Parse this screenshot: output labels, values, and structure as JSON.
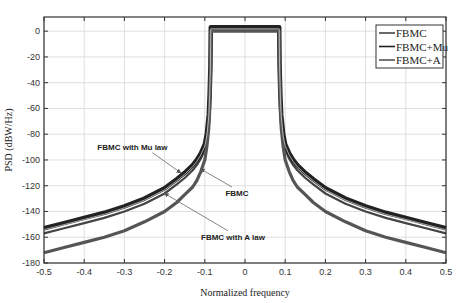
{
  "chart_data": {
    "type": "line",
    "title": "",
    "xlabel": "Normalized frequency",
    "ylabel": "PSD (dBW/Hz)",
    "xlim": [
      -0.5,
      0.5
    ],
    "ylim": [
      -180,
      11
    ],
    "xticks": [
      -0.5,
      -0.4,
      -0.3,
      -0.2,
      -0.1,
      0,
      0.1,
      0.2,
      0.3,
      0.4,
      0.5
    ],
    "xtick_labels": [
      "-0.5",
      "-0.4",
      "-0.3",
      "-0.2",
      "-0.1",
      "0",
      "0.1",
      "0.2",
      "0.3",
      "0.4",
      "0.5"
    ],
    "yticks": [
      0,
      -20,
      -40,
      -60,
      -80,
      -100,
      -120,
      -140,
      -160,
      -180
    ],
    "ytick_labels": [
      "0",
      "-20",
      "-40",
      "-60",
      "-80",
      "-100",
      "-120",
      "-140",
      "-160",
      "-180"
    ],
    "grid": true,
    "legend_position": "upper right",
    "x": [
      -0.5,
      -0.45,
      -0.4,
      -0.35,
      -0.3,
      -0.25,
      -0.2,
      -0.17,
      -0.15,
      -0.13,
      -0.12,
      -0.11,
      -0.1,
      -0.095,
      -0.09,
      -0.088,
      -0.086,
      -0.085,
      0,
      0.085,
      0.086,
      0.088,
      0.09,
      0.095,
      0.1,
      0.11,
      0.12,
      0.13,
      0.15,
      0.17,
      0.2,
      0.25,
      0.3,
      0.35,
      0.4,
      0.45,
      0.5
    ],
    "series": [
      {
        "name": "FBMC",
        "color": "#444444",
        "values": [
          -157,
          -153,
          -149,
          -145,
          -140,
          -134,
          -126,
          -119,
          -114,
          -108,
          -104,
          -99,
          -92,
          -84,
          -70,
          -55,
          -30,
          2,
          2,
          2,
          -30,
          -55,
          -70,
          -84,
          -92,
          -99,
          -104,
          -108,
          -114,
          -119,
          -126,
          -134,
          -140,
          -145,
          -149,
          -153,
          -157
        ]
      },
      {
        "name": "FBMC+Mu",
        "color": "#222222",
        "values": [
          -153,
          -149,
          -145,
          -141,
          -136,
          -130,
          -122,
          -115,
          -110,
          -104,
          -100,
          -95,
          -88,
          -80,
          -65,
          -50,
          -28,
          3,
          3,
          3,
          -28,
          -50,
          -65,
          -80,
          -88,
          -95,
          -100,
          -104,
          -110,
          -115,
          -122,
          -130,
          -136,
          -141,
          -145,
          -149,
          -153
        ]
      },
      {
        "name": "FBMC+A",
        "color": "#555555",
        "values": [
          -172,
          -168,
          -164,
          -160,
          -155,
          -148,
          -140,
          -133,
          -127,
          -121,
          -116,
          -109,
          -100,
          -90,
          -75,
          -58,
          -32,
          0,
          0,
          0,
          -32,
          -58,
          -75,
          -90,
          -100,
          -109,
          -116,
          -121,
          -127,
          -133,
          -140,
          -148,
          -155,
          -160,
          -164,
          -168,
          -172
        ]
      }
    ],
    "annotations": [
      {
        "text": "FBMC with Mu law",
        "x": -0.28,
        "y": -92,
        "arrow_to": [
          -0.16,
          -110
        ]
      },
      {
        "text": "FBMC",
        "x": -0.02,
        "y": -128,
        "arrow_to": [
          -0.11,
          -107
        ]
      },
      {
        "text": "FBMC with A law",
        "x": -0.03,
        "y": -162,
        "arrow_to": [
          -0.2,
          -126
        ]
      }
    ]
  },
  "legend": {
    "items": [
      {
        "label": "FBMC"
      },
      {
        "label": "FBMC+Mu"
      },
      {
        "label": "FBMC+A"
      }
    ]
  }
}
